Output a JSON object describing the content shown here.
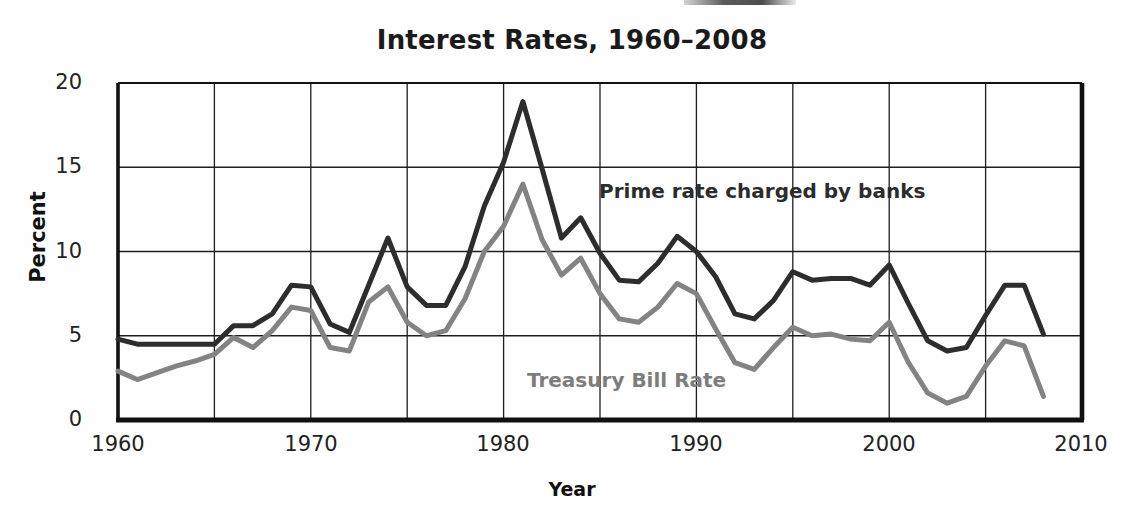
{
  "chart_data": {
    "type": "line",
    "title": "Interest Rates, 1960–2008",
    "xlabel": "Year",
    "ylabel": "Percent",
    "xlim": [
      1960,
      2010
    ],
    "ylim": [
      0,
      20
    ],
    "xticks": [
      "1960",
      "1970",
      "1980",
      "1990",
      "2000",
      "2010"
    ],
    "xtick_values": [
      1960,
      1970,
      1980,
      1990,
      2000,
      2010
    ],
    "yticks": [
      "0",
      "5",
      "10",
      "15",
      "20"
    ],
    "ytick_values": [
      0,
      5,
      10,
      15,
      20
    ],
    "grid": "both",
    "grid_x_step": 5,
    "grid_y_step": 5,
    "legend_position": "inline-annotations",
    "x": [
      1960,
      1961,
      1962,
      1963,
      1964,
      1965,
      1966,
      1967,
      1968,
      1969,
      1970,
      1971,
      1972,
      1973,
      1974,
      1975,
      1976,
      1977,
      1978,
      1979,
      1980,
      1981,
      1982,
      1983,
      1984,
      1985,
      1986,
      1987,
      1988,
      1989,
      1990,
      1991,
      1992,
      1993,
      1994,
      1995,
      1996,
      1997,
      1998,
      1999,
      2000,
      2001,
      2002,
      2003,
      2004,
      2005,
      2006,
      2007,
      2008
    ],
    "series": [
      {
        "name": "Prime rate charged by banks",
        "color": "#2d2d2d",
        "values": [
          4.8,
          4.5,
          4.5,
          4.5,
          4.5,
          4.5,
          5.6,
          5.6,
          6.3,
          8.0,
          7.9,
          5.7,
          5.2,
          8.0,
          10.8,
          7.9,
          6.8,
          6.8,
          9.1,
          12.7,
          15.3,
          18.9,
          14.9,
          10.8,
          12.0,
          9.9,
          8.3,
          8.2,
          9.3,
          10.9,
          10.0,
          8.5,
          6.3,
          6.0,
          7.1,
          8.8,
          8.3,
          8.4,
          8.4,
          8.0,
          9.2,
          6.9,
          4.7,
          4.1,
          4.3,
          6.2,
          8.0,
          8.0,
          5.1
        ]
      },
      {
        "name": "Treasury Bill Rate",
        "color": "#838383",
        "values": [
          2.9,
          2.4,
          2.8,
          3.2,
          3.5,
          3.9,
          4.9,
          4.3,
          5.3,
          6.7,
          6.5,
          4.3,
          4.1,
          7.0,
          7.9,
          5.8,
          5.0,
          5.3,
          7.2,
          10.0,
          11.5,
          14.0,
          10.7,
          8.6,
          9.6,
          7.5,
          6.0,
          5.8,
          6.7,
          8.1,
          7.5,
          5.4,
          3.4,
          3.0,
          4.3,
          5.5,
          5.0,
          5.1,
          4.8,
          4.7,
          5.8,
          3.4,
          1.6,
          1.0,
          1.4,
          3.2,
          4.7,
          4.4,
          1.4
        ]
      }
    ],
    "annotations": [
      {
        "name": "prime-rate-label",
        "text": "Prime rate charged by banks",
        "color": "#2c2c2c"
      },
      {
        "name": "treasury-bill-label",
        "text": "Treasury Bill Rate",
        "color": "#7d7d7d"
      }
    ]
  }
}
